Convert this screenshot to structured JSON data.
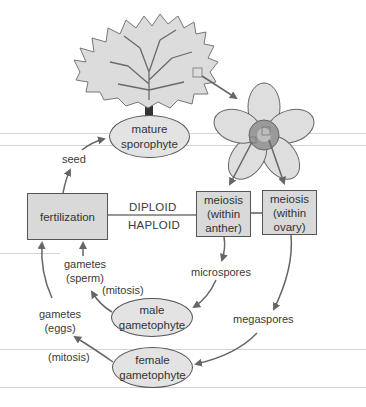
{
  "diagram": {
    "nodes": {
      "mature_sporophyte": {
        "line1": "mature",
        "line2": "sporophyte"
      },
      "fertilization": {
        "label": "fertilization"
      },
      "meiosis_anther": {
        "line1": "meiosis",
        "line2": "(within",
        "line3": "anther)"
      },
      "meiosis_ovary": {
        "line1": "meiosis",
        "line2": "(within",
        "line3": "ovary)"
      },
      "male_gametophyte": {
        "line1": "male",
        "line2": "gametophyte"
      },
      "female_gametophyte": {
        "line1": "female",
        "line2": "gametophyte"
      }
    },
    "labels": {
      "seed": "seed",
      "diploid": "DIPLOID",
      "haploid": "HAPLOID",
      "microspores": "microspores",
      "megaspores": "megaspores",
      "gametes_sperm_1": "gametes",
      "gametes_sperm_2": "(sperm)",
      "gametes_eggs_1": "gametes",
      "gametes_eggs_2": "(eggs)",
      "mitosis_male": "(mitosis)",
      "mitosis_female": "(mitosis)"
    },
    "illustrations": [
      "tree-illustration",
      "flower-illustration"
    ],
    "colors": {
      "box_fill": "#d9d9d9",
      "ellipse_fill": "#e3e3e3",
      "stroke": "#555555",
      "arrow": "#666666",
      "rule_line": "#d4d4d4"
    }
  }
}
